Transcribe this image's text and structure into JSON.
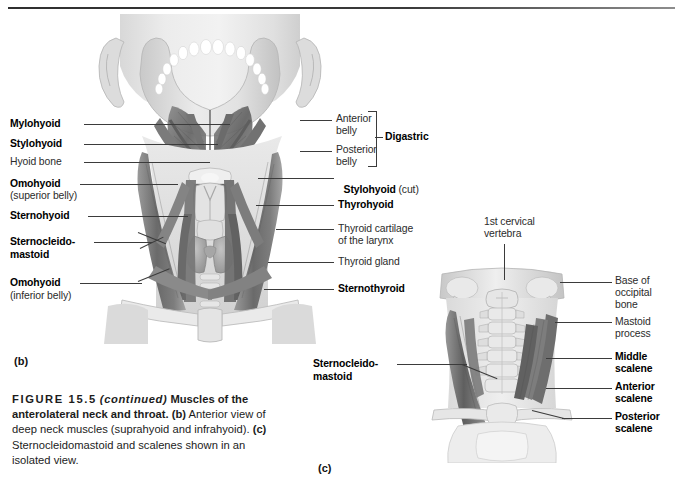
{
  "figure": {
    "number": "FIGURE 15.5",
    "continued": "(continued)",
    "title_line1": "Muscles of the",
    "title_line2": "anterolateral neck and throat.",
    "part_b_tag": "(b)",
    "part_b_text": " Anterior view of",
    "body_line3": "deep neck muscles (suprahyoid and infrahyoid).",
    "part_c_tag": "(c)",
    "part_c_text": " Sternocleidomastoid and scalenes shown in an",
    "body_line5": "isolated view."
  },
  "panels": {
    "b": {
      "tag": "(b)"
    },
    "c": {
      "tag": "(c)"
    }
  },
  "panel_b_labels_left": [
    {
      "text": "Mylohyoid",
      "weight": "bold",
      "sub": ""
    },
    {
      "text": "Stylohyoid",
      "weight": "bold",
      "sub": ""
    },
    {
      "text": "Hyoid bone",
      "weight": "regular",
      "sub": ""
    },
    {
      "text": "Omohyoid",
      "weight": "bold",
      "sub": "(superior belly)"
    },
    {
      "text": "Sternohyoid",
      "weight": "bold",
      "sub": ""
    },
    {
      "text": "Sternocleido-",
      "weight": "bold",
      "sub": "mastoid",
      "sub_weight": "bold"
    },
    {
      "text": "Omohyoid",
      "weight": "bold",
      "sub": "(inferior belly)"
    }
  ],
  "panel_b_labels_right": [
    {
      "text": "Anterior",
      "line2": "belly",
      "weight": "regular"
    },
    {
      "text": "Posterior",
      "line2": "belly",
      "weight": "regular"
    },
    {
      "text": "Digastric",
      "weight": "bold",
      "group": true
    },
    {
      "text": "Stylohyoid",
      "weight": "bold",
      "suffix": " (cut)"
    },
    {
      "text": "Thyrohyoid",
      "weight": "bold"
    },
    {
      "text": "Thyroid cartilage",
      "line2": "of the larynx",
      "weight": "regular"
    },
    {
      "text": "Thyroid gland",
      "weight": "regular"
    },
    {
      "text": "Sternothyroid",
      "weight": "bold"
    }
  ],
  "panel_c_labels": [
    {
      "text": "1st cervical",
      "line2": "vertebra",
      "weight": "regular",
      "side": "top"
    },
    {
      "text": "Sternocleido-",
      "line2": "mastoid",
      "weight": "bold",
      "side": "left"
    },
    {
      "text": "Base of",
      "line2": "occipital",
      "line3": "bone",
      "weight": "regular",
      "side": "right"
    },
    {
      "text": "Mastoid",
      "line2": "process",
      "weight": "regular",
      "side": "right"
    },
    {
      "text": "Middle",
      "line2": "scalene",
      "weight": "bold",
      "side": "right"
    },
    {
      "text": "Anterior",
      "line2": "scalene",
      "weight": "bold",
      "side": "right"
    },
    {
      "text": "Posterior",
      "line2": "scalene",
      "weight": "bold",
      "side": "right"
    }
  ],
  "colors": {
    "rule": "#2f2f2f",
    "text": "#1a1a1a",
    "leader": "#3b3b3b",
    "muscle_dark": "#6e6e6e",
    "muscle_mid": "#8c8c8c",
    "bone_light": "#dcdcdc",
    "skin": "#e6e6e6"
  }
}
